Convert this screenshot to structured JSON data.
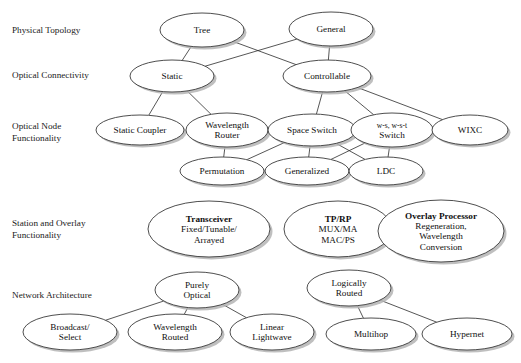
{
  "figure": {
    "background": "#ffffff",
    "node_fill": "#ffffff",
    "node_stroke": "#3a3a3a",
    "shadow_color": "#b4b4b4",
    "edge_color": "#2b2b2b",
    "width": 521,
    "height": 363
  },
  "row_labels": [
    {
      "id": "row-physical-topology",
      "text": "Physical Topology",
      "x": 12,
      "y": 33
    },
    {
      "id": "row-optical-connectivity",
      "text": "Optical Connectivity",
      "x": 12,
      "y": 78
    },
    {
      "id": "row-optical-node-functionality",
      "lines": [
        "Optical Node",
        "Functionality"
      ],
      "x": 12,
      "y": 129
    },
    {
      "id": "row-station-overlay-functionality",
      "lines": [
        "Station and Overlay",
        "Functionality"
      ],
      "x": 12,
      "y": 226
    },
    {
      "id": "row-network-architecture",
      "text": "Network Architecture",
      "x": 12,
      "y": 298
    }
  ],
  "nodes": [
    {
      "id": "tree",
      "lines": [
        "Tree"
      ],
      "cx": 202,
      "cy": 30,
      "rx": 42,
      "ry": 17
    },
    {
      "id": "general",
      "lines": [
        "General"
      ],
      "cx": 331,
      "cy": 29,
      "rx": 42,
      "ry": 17
    },
    {
      "id": "static",
      "lines": [
        "Static"
      ],
      "cx": 172,
      "cy": 76,
      "rx": 42,
      "ry": 16
    },
    {
      "id": "controllable",
      "lines": [
        "Controllable"
      ],
      "cx": 327,
      "cy": 76,
      "rx": 44,
      "ry": 16
    },
    {
      "id": "static-coupler",
      "lines": [
        "Static Coupler"
      ],
      "cx": 140,
      "cy": 130,
      "rx": 44,
      "ry": 15
    },
    {
      "id": "wavelength-router",
      "lines": [
        "Wavelength",
        "Router"
      ],
      "cx": 227,
      "cy": 130,
      "rx": 41,
      "ry": 17
    },
    {
      "id": "space-switch",
      "lines": [
        "Space Switch"
      ],
      "cx": 312,
      "cy": 130,
      "rx": 44,
      "ry": 16
    },
    {
      "id": "ws-wst-switch",
      "lines": [
        "w-s, w-s-t",
        "Switch"
      ],
      "small_first": true,
      "cx": 392,
      "cy": 130,
      "rx": 41,
      "ry": 17
    },
    {
      "id": "wixc",
      "lines": [
        "WIXC"
      ],
      "cx": 470,
      "cy": 130,
      "rx": 38,
      "ry": 15
    },
    {
      "id": "permutation",
      "lines": [
        "Permutation"
      ],
      "cx": 222,
      "cy": 171,
      "rx": 42,
      "ry": 14
    },
    {
      "id": "generalized",
      "lines": [
        "Generalized"
      ],
      "cx": 307,
      "cy": 171,
      "rx": 42,
      "ry": 14
    },
    {
      "id": "ldc",
      "lines": [
        "LDC"
      ],
      "cx": 386,
      "cy": 171,
      "rx": 37,
      "ry": 14
    },
    {
      "id": "transceiver",
      "lines": [
        "Transceiver",
        "Fixed/Tunable/",
        "Arrayed"
      ],
      "bold_first": true,
      "cx": 209,
      "cy": 229,
      "rx": 61,
      "ry": 28
    },
    {
      "id": "tp-rp",
      "lines": [
        "TP/RP",
        "MUX/MA",
        "MAC/PS"
      ],
      "bold_first": true,
      "cx": 338,
      "cy": 229,
      "rx": 54,
      "ry": 28
    },
    {
      "id": "overlay-processor",
      "lines": [
        "Overlay Processor",
        "Regeneration,",
        "Wavelength",
        "Conversion"
      ],
      "bold_first": true,
      "cx": 441,
      "cy": 231,
      "rx": 63,
      "ry": 31
    },
    {
      "id": "purely-optical",
      "lines": [
        "Purely",
        "Optical"
      ],
      "cx": 197,
      "cy": 290,
      "rx": 42,
      "ry": 18
    },
    {
      "id": "logically-routed",
      "lines": [
        "Logically",
        "Routed"
      ],
      "cx": 349,
      "cy": 288,
      "rx": 42,
      "ry": 18
    },
    {
      "id": "broadcast-select",
      "lines": [
        "Broadcast/",
        "Select"
      ],
      "cx": 70,
      "cy": 332,
      "rx": 47,
      "ry": 18
    },
    {
      "id": "wavelength-routed",
      "lines": [
        "Wavelength",
        "Routed"
      ],
      "cx": 175,
      "cy": 332,
      "rx": 47,
      "ry": 18
    },
    {
      "id": "linear-lightwave",
      "lines": [
        "Linear",
        "Lightwave"
      ],
      "cx": 272,
      "cy": 332,
      "rx": 42,
      "ry": 18
    },
    {
      "id": "multihop",
      "lines": [
        "Multihop"
      ],
      "cx": 371,
      "cy": 334,
      "rx": 45,
      "ry": 16
    },
    {
      "id": "hypernet",
      "lines": [
        "Hypernet"
      ],
      "cx": 467,
      "cy": 334,
      "rx": 45,
      "ry": 16
    }
  ],
  "edges": [
    {
      "from": "tree",
      "to": "static"
    },
    {
      "from": "tree",
      "to": "controllable"
    },
    {
      "from": "general",
      "to": "static"
    },
    {
      "from": "general",
      "to": "controllable"
    },
    {
      "from": "static",
      "to": "static-coupler"
    },
    {
      "from": "static",
      "to": "wavelength-router"
    },
    {
      "from": "controllable",
      "to": "space-switch"
    },
    {
      "from": "controllable",
      "to": "ws-wst-switch"
    },
    {
      "from": "controllable",
      "to": "wixc"
    },
    {
      "from": "wavelength-router",
      "to": "permutation"
    },
    {
      "from": "space-switch",
      "to": "permutation"
    },
    {
      "from": "space-switch",
      "to": "generalized"
    },
    {
      "from": "space-switch",
      "to": "ldc"
    },
    {
      "from": "ws-wst-switch",
      "to": "generalized"
    },
    {
      "from": "ws-wst-switch",
      "to": "ldc"
    },
    {
      "from": "purely-optical",
      "to": "broadcast-select"
    },
    {
      "from": "purely-optical",
      "to": "wavelength-routed"
    },
    {
      "from": "purely-optical",
      "to": "linear-lightwave"
    },
    {
      "from": "logically-routed",
      "to": "multihop"
    },
    {
      "from": "logically-routed",
      "to": "hypernet"
    }
  ]
}
